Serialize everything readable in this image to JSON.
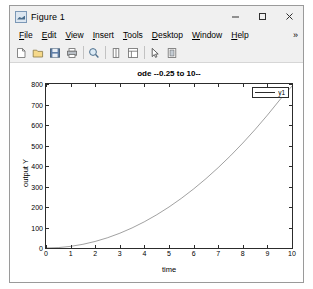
{
  "window": {
    "title": "Figure 1",
    "app_icon": "matlab-figure-icon",
    "controls": {
      "minimize": "minimize-icon",
      "maximize": "maximize-icon",
      "close": "close-icon"
    }
  },
  "menu": {
    "items": [
      {
        "label": "File",
        "mnemonic": "F"
      },
      {
        "label": "Edit",
        "mnemonic": "E"
      },
      {
        "label": "View",
        "mnemonic": "V"
      },
      {
        "label": "Insert",
        "mnemonic": "I"
      },
      {
        "label": "Tools",
        "mnemonic": "T"
      },
      {
        "label": "Desktop",
        "mnemonic": "D"
      },
      {
        "label": "Window",
        "mnemonic": "W"
      },
      {
        "label": "Help",
        "mnemonic": "H"
      }
    ],
    "overflow": "»"
  },
  "toolbar": {
    "buttons": [
      {
        "name": "new-figure-icon",
        "title": "New Figure"
      },
      {
        "name": "open-file-icon",
        "title": "Open File"
      },
      {
        "name": "save-figure-icon",
        "title": "Save Figure"
      },
      {
        "name": "print-figure-icon",
        "title": "Print Figure"
      },
      {
        "name": "zoom-in-icon",
        "title": "Zoom In"
      },
      {
        "name": "data-cursor-icon",
        "title": "Data Cursor"
      },
      {
        "name": "insert-legend-icon",
        "title": "Insert Legend"
      },
      {
        "name": "edit-plot-icon",
        "title": "Edit Plot"
      },
      {
        "name": "insert-colorbar-icon",
        "title": "Insert Colorbar"
      }
    ]
  },
  "chart_data": {
    "type": "line",
    "title": "ode --0.25 to 10--",
    "xlabel": "time",
    "ylabel": "output Y",
    "xlim": [
      0,
      10
    ],
    "ylim": [
      0,
      800
    ],
    "xticks": [
      0,
      1,
      2,
      3,
      4,
      5,
      6,
      7,
      8,
      9,
      10
    ],
    "yticks": [
      0,
      100,
      200,
      300,
      400,
      500,
      600,
      700,
      800
    ],
    "grid": false,
    "legend": {
      "position": "top-right",
      "entries": [
        "y1"
      ]
    },
    "line_color": "#2c2c2c",
    "series": [
      {
        "name": "y1",
        "x": [
          0,
          0.5,
          1,
          1.5,
          2,
          2.5,
          3,
          3.5,
          4,
          4.5,
          5,
          5.5,
          6,
          6.5,
          7,
          7.5,
          8,
          8.5,
          9,
          9.5,
          10
        ],
        "y": [
          0,
          2,
          8,
          18,
          32,
          50,
          72,
          98,
          128,
          162,
          200,
          242,
          288,
          338,
          392,
          450,
          512,
          578,
          648,
          722,
          790
        ]
      }
    ]
  }
}
